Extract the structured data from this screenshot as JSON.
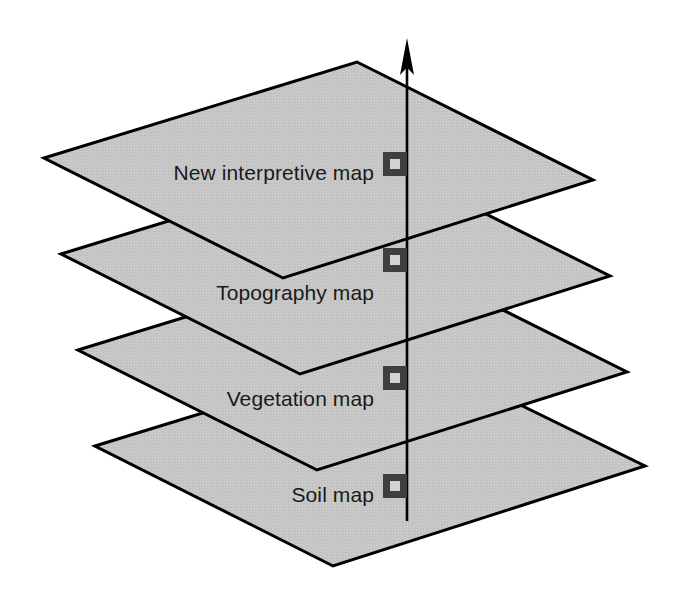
{
  "diagram": {
    "type": "layered-map-stack",
    "background_color": "#ffffff",
    "layer_fill_color": "#c6c6c6",
    "layer_stroke_color": "#000000",
    "marker_color": "#3f3f3f",
    "marker_inner_color": "#d2d2d2",
    "axis_color": "#000000",
    "axis": {
      "name": "vertical-registration-axis",
      "x": 407,
      "top_y": 40,
      "bottom_y": 521,
      "arrow_direction": "up",
      "arrow_tip_y": 40
    },
    "layers": [
      {
        "id": "new-interpretive-map",
        "label": "New interpretive map",
        "order": 1,
        "label_x": 374,
        "label_y": 172,
        "marker_x": 383,
        "marker_y": 152,
        "points": "44,158 357,62 593,180 283,278"
      },
      {
        "id": "topography-map",
        "label": "Topography map",
        "order": 2,
        "label_x": 374,
        "label_y": 292,
        "marker_x": 383,
        "marker_y": 248,
        "points": "61,254 374,158 610,276 300,374"
      },
      {
        "id": "vegetation-map",
        "label": "Vegetation map",
        "order": 3,
        "label_x": 374,
        "label_y": 398,
        "marker_x": 383,
        "marker_y": 366,
        "points": "78,350 391,254 627,372 317,470"
      },
      {
        "id": "soil-map",
        "label": "Soil map",
        "order": 4,
        "label_x": 374,
        "label_y": 494,
        "marker_x": 383,
        "marker_y": 474,
        "points": "95,446 408,350 645,466 333,566"
      }
    ],
    "marker": {
      "name": "registration-marker",
      "size": 24,
      "inner_size": 10,
      "shape": "square-with-square-hole"
    }
  }
}
